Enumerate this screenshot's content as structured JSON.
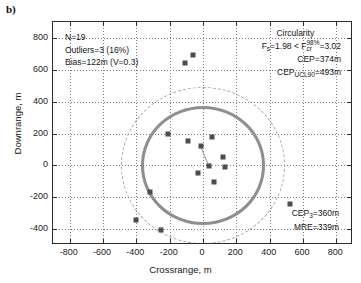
{
  "panel": {
    "label": "b)"
  },
  "chart_data": {
    "type": "scatter",
    "title": "",
    "xlabel": "Crossrange, m",
    "ylabel": "Downrange, m",
    "xlim": [
      -900,
      900
    ],
    "ylim": [
      -500,
      900
    ],
    "xticks": [
      -800,
      -600,
      -400,
      -200,
      0,
      200,
      400,
      600,
      800
    ],
    "yticks": [
      800,
      600,
      400,
      200,
      0,
      -200,
      -400
    ],
    "xticklabels": [
      "-800",
      "-600",
      "-400",
      "-200",
      "0",
      "200",
      "400",
      "600",
      "800"
    ],
    "yticklabels": [
      "800",
      "600",
      "400",
      "200",
      "0",
      "-200",
      "-400"
    ],
    "grid": true,
    "legend": "none",
    "marker": {
      "shape": "square",
      "color": "#4d4d4d",
      "size": 5
    },
    "points": [
      {
        "x": -60,
        "y": 690
      },
      {
        "x": -110,
        "y": 640
      },
      {
        "x": -210,
        "y": 200
      },
      {
        "x": -90,
        "y": 155
      },
      {
        "x": 55,
        "y": 175
      },
      {
        "x": -15,
        "y": 120
      },
      {
        "x": 120,
        "y": 55
      },
      {
        "x": 35,
        "y": -5
      },
      {
        "x": 130,
        "y": -10
      },
      {
        "x": -30,
        "y": -50
      },
      {
        "x": 65,
        "y": -105
      },
      {
        "x": -320,
        "y": -165
      },
      {
        "x": 520,
        "y": -245
      },
      {
        "x": -400,
        "y": -345
      },
      {
        "x": -255,
        "y": -405
      }
    ],
    "circles": [
      {
        "name": "CEP",
        "style": "solid",
        "color": "#8e8e8e",
        "radius_m": 374,
        "center": [
          0,
          0
        ]
      },
      {
        "name": "CEP_UCL90",
        "style": "dashed",
        "color": "#a3a3a3",
        "radius_m": 493,
        "center": [
          0,
          0
        ]
      }
    ],
    "annotations": {
      "stats": {
        "n": "N=19",
        "outliers": "Outliers=3 (16%)",
        "bias": "Bias=122m (V=0.3)"
      },
      "circularity": {
        "title": "Circularity",
        "f_test_prefix": "F",
        "f_test_sub": "s",
        "f_test_mid": "=1.98 < F",
        "f_test_crit_sup": "98%",
        "f_test_crit_sub": "cr",
        "f_test_suffix": "=3.02",
        "cep": "CEP=374m",
        "cep_ucl_prefix": "CEP",
        "cep_ucl_sub": "UCL90",
        "cep_ucl_suffix": "=493m"
      },
      "bottom": {
        "cep3_prefix": "CEP",
        "cep3_sub": "3",
        "cep3_suffix": "=360m",
        "mre": "MRE=339m"
      }
    }
  }
}
